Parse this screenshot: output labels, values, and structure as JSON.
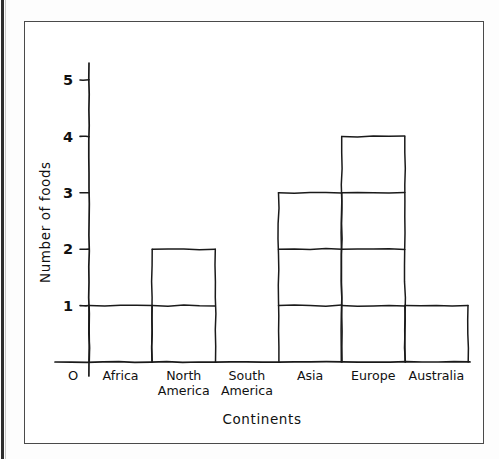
{
  "chart_data": {
    "type": "bar",
    "title": "",
    "subtitle": "",
    "xlabel": "Continents",
    "ylabel": "Number of foods",
    "categories": [
      "Africa",
      "North America",
      "South America",
      "Asia",
      "Europe",
      "Australia"
    ],
    "values": [
      1,
      2,
      0,
      3,
      4,
      1
    ],
    "series": [
      {
        "name": "Number of foods",
        "values": [
          1,
          2,
          0,
          3,
          4,
          1
        ]
      }
    ],
    "ylim": [
      0,
      5
    ],
    "ytick_labels": [
      "1",
      "2",
      "3",
      "4",
      "5"
    ],
    "ytick_values": [
      1,
      2,
      3,
      4,
      5
    ],
    "origin_label": "O",
    "grid": "horizontal-segments-over-bars",
    "legend": "none",
    "style": "hand-drawn",
    "colors": {
      "ink": "#1a1a1a",
      "frame": "#4a4a4a",
      "background": "#ffffff"
    }
  },
  "category_labels": [
    {
      "line1": "Africa",
      "line2": ""
    },
    {
      "line1": "North",
      "line2": "America"
    },
    {
      "line1": "South",
      "line2": "America"
    },
    {
      "line1": "Asia",
      "line2": ""
    },
    {
      "line1": "Europe",
      "line2": ""
    },
    {
      "line1": "Australia",
      "line2": ""
    }
  ]
}
